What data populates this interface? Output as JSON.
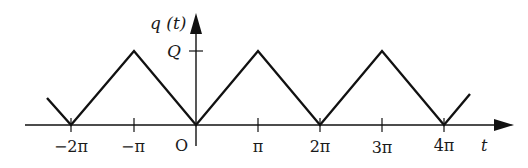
{
  "diagram": {
    "type": "triangle-wave-plot",
    "y_axis_label": "q (t)",
    "x_axis_label": "t",
    "peak_label": "Q",
    "origin_label": "O",
    "x_ticks": [
      {
        "label": "−2π",
        "value": -2
      },
      {
        "label": "−π",
        "value": -1
      },
      {
        "label": "π",
        "value": 1
      },
      {
        "label": "2π",
        "value": 2
      },
      {
        "label": "3π",
        "value": 3
      },
      {
        "label": "4π",
        "value": 4
      }
    ],
    "waveform": {
      "description": "Periodic triangular wave with period 2π, zero at even multiples of π, peak Q at odd multiples of π",
      "points_in_pi_units": [
        [
          -2.4,
          0.4
        ],
        [
          -2,
          0
        ],
        [
          -1,
          1
        ],
        [
          0,
          0
        ],
        [
          1,
          1
        ],
        [
          2,
          0
        ],
        [
          3,
          1
        ],
        [
          4,
          0
        ],
        [
          4.4,
          0.4
        ]
      ]
    },
    "colors": {
      "line": "#111111",
      "background": "#ffffff"
    }
  }
}
